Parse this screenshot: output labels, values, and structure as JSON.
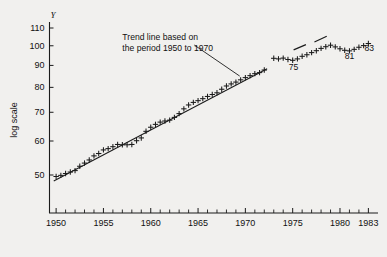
{
  "figure": {
    "background_color": "#f1f0ee",
    "ink_color": "#1b1b1b"
  },
  "chart_data": {
    "type": "scatter",
    "title": "",
    "subtitle": "",
    "xlabel": "",
    "ylabel": "log scale",
    "y_axis_symbol": "Y",
    "y_scale": "log",
    "ylim": [
      44,
      115
    ],
    "xlim": [
      1949.3,
      1983.7
    ],
    "grid": false,
    "legend_position": "none",
    "yticks": [
      50,
      60,
      70,
      80,
      90,
      100,
      110
    ],
    "ytick_labels": [
      "50",
      "60",
      "70",
      "80",
      "90",
      "100",
      "110"
    ],
    "xticks": [
      1950,
      1955,
      1960,
      1965,
      1970,
      1975,
      1980,
      1983
    ],
    "xtick_labels": [
      "1950",
      "1955",
      "1960",
      "1965",
      "1970",
      "1975",
      "1980",
      "1983"
    ],
    "x_minor_tick_step": 1,
    "marker_style": "plus",
    "series": [
      {
        "name": "observed",
        "x": [
          1950.0,
          1950.5,
          1951.0,
          1951.5,
          1952.0,
          1952.5,
          1953.0,
          1953.5,
          1954.0,
          1954.5,
          1955.0,
          1955.5,
          1956.0,
          1956.5,
          1957.0,
          1957.5,
          1958.0,
          1958.5,
          1959.0,
          1959.5,
          1960.0,
          1960.5,
          1961.0,
          1961.5,
          1962.0,
          1962.5,
          1963.0,
          1963.5,
          1964.0,
          1964.5,
          1965.0,
          1965.5,
          1966.0,
          1966.5,
          1967.0,
          1967.5,
          1968.0,
          1968.5,
          1969.0,
          1969.5,
          1970.0,
          1970.5,
          1971.0,
          1971.5,
          1972.0,
          1973.0,
          1973.5,
          1974.0,
          1974.5,
          1975.0,
          1975.5,
          1976.0,
          1976.5,
          1977.0,
          1977.5,
          1978.0,
          1978.5,
          1979.0,
          1979.5,
          1980.0,
          1980.5,
          1981.0,
          1981.5,
          1982.0,
          1982.5,
          1983.0
        ],
        "y": [
          49.6,
          49.9,
          50.4,
          50.8,
          51.2,
          52.4,
          53.3,
          54.2,
          55.4,
          56.1,
          57.2,
          57.6,
          58.2,
          58.9,
          58.8,
          58.8,
          58.9,
          60.1,
          61.0,
          63.2,
          64.6,
          65.6,
          66.4,
          66.8,
          67.1,
          68.1,
          69.5,
          71.3,
          72.8,
          73.8,
          74.5,
          75.3,
          76.2,
          77.0,
          77.7,
          79.2,
          80.6,
          81.5,
          82.3,
          83.3,
          84.3,
          85.2,
          86.1,
          86.6,
          87.8,
          93.5,
          93.2,
          93.6,
          92.9,
          92.5,
          93.2,
          94.5,
          95.3,
          96.4,
          97.4,
          98.6,
          99.5,
          100.3,
          99.4,
          98.4,
          97.6,
          97.3,
          98.1,
          99.2,
          100.1,
          101.2
        ]
      }
    ],
    "trend_line": {
      "label": "Trend line based on the period 1950 to 1970",
      "fit_period": [
        1950,
        1970
      ],
      "x_start": 1949.75,
      "y_start": 48.4,
      "x_end": 1972.3,
      "y_end": 88.4,
      "style": "solid"
    },
    "dashed_segments": [
      {
        "x_start": 1975.1,
        "y_start": 97.8,
        "x_end": 1976.4,
        "y_end": 100.6
      },
      {
        "x_start": 1977.3,
        "y_start": 102.0,
        "x_end": 1978.6,
        "y_end": 105.2
      }
    ],
    "annotations": [
      {
        "name": "trend-note",
        "line1": "Trend line based on",
        "line2": "the period 1950 to 1970",
        "x": 1957.0,
        "y": 103.0
      },
      {
        "name": "year-label-75",
        "text": "75",
        "x": 1975.1,
        "y": 88.0
      },
      {
        "name": "year-label-81",
        "text": "81",
        "x": 1981.0,
        "y": 93.0
      },
      {
        "name": "year-label-83",
        "text": "83",
        "x": 1983.1,
        "y": 97.0
      }
    ],
    "leader_line": {
      "from": {
        "x": 1964.6,
        "y": 100.4
      },
      "to": {
        "x": 1969.4,
        "y": 85.0
      }
    }
  }
}
